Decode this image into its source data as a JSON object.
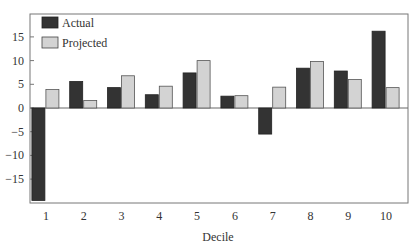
{
  "chart_data": {
    "type": "bar",
    "title": "",
    "xlabel": "Decile",
    "ylabel": "",
    "categories": [
      "1",
      "2",
      "3",
      "4",
      "5",
      "6",
      "7",
      "8",
      "9",
      "10"
    ],
    "series": [
      {
        "name": "Actual",
        "color": "#333333",
        "values": [
          -19.5,
          5.6,
          4.3,
          2.8,
          7.4,
          2.5,
          -5.5,
          8.4,
          7.8,
          16.2
        ]
      },
      {
        "name": "Projected",
        "color": "#d3d3d3",
        "values": [
          3.9,
          1.6,
          6.8,
          4.6,
          10.0,
          2.6,
          4.4,
          9.8,
          6.0,
          4.3
        ]
      }
    ],
    "yticks": [
      15,
      10,
      5,
      0,
      -15
    ],
    "yticks_all": [
      15,
      10,
      5,
      0,
      -5,
      -10,
      -15
    ],
    "ytick_labels": [
      "15",
      "10",
      "5",
      "0",
      "−5",
      "−10",
      "−15"
    ],
    "ylim": [
      -20.5,
      19.5
    ],
    "grid": false,
    "legend_position": "upper-left"
  },
  "legend": {
    "actual_label": "Actual",
    "projected_label": "Projected"
  },
  "axis": {
    "xlabel": "Decile"
  }
}
